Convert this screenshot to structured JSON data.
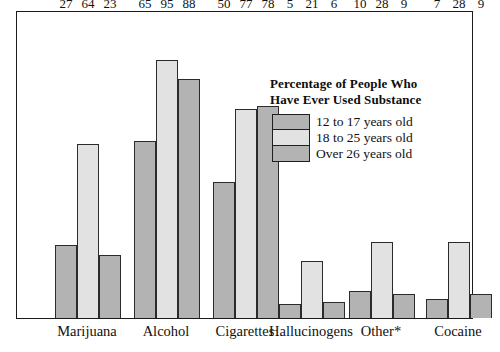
{
  "chart_data": {
    "type": "bar",
    "title": "",
    "xlabel": "",
    "ylabel": "",
    "ylim": [
      0,
      100
    ],
    "grid": false,
    "legend_position": "inside-top-right",
    "legend_title_lines": [
      "Percentage of People Who",
      "Have Ever Used Substance"
    ],
    "categories": [
      "Marijuana",
      "Alcohol",
      "Cigarettes",
      "Hallucinogens",
      "Other*",
      "Cocaine"
    ],
    "series": [
      {
        "name": "12 to 17 years old",
        "color": "#b3b3b3",
        "values": [
          27,
          65,
          50,
          5,
          10,
          7
        ]
      },
      {
        "name": "18 to 25 years old",
        "color": "#e2e2e2",
        "values": [
          64,
          95,
          77,
          21,
          28,
          28
        ]
      },
      {
        "name": "Over 26 years old",
        "color": "#b3b3b3",
        "values": [
          23,
          88,
          78,
          6,
          9,
          9
        ]
      }
    ]
  },
  "colors": {
    "series_12_17": "#b3b3b3",
    "series_18_25": "#e2e2e2",
    "series_over_26": "#b3b3b3",
    "frame": "#1b1b1b",
    "text": "#111111",
    "background": "#ffffff"
  }
}
